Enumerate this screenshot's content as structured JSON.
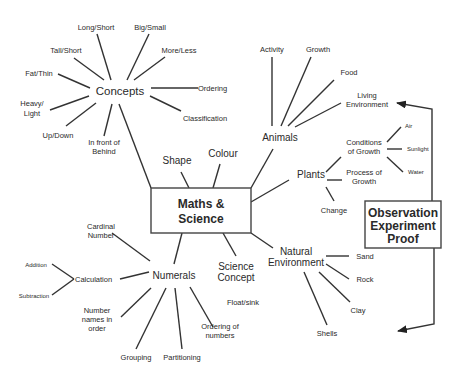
{
  "diagram": {
    "type": "concept-map",
    "central": {
      "line1": "Maths &",
      "line2": "Science"
    },
    "side_box": {
      "line1": "Observation",
      "line2": "Experiment",
      "line3": "Proof"
    },
    "concepts": {
      "label": "Concepts",
      "children": [
        "Long/Short",
        "Big/Small",
        "Tall/Short",
        "More/Less",
        "Fat/Thin",
        "Ordering",
        "Heavy/",
        "Light",
        "Classification",
        "Up/Down",
        "In front of",
        "Behind"
      ]
    },
    "shape": "Shape",
    "colour": "Colour",
    "animals": {
      "label": "Animals",
      "children": [
        "Activity",
        "Growth",
        "Food",
        "Living",
        "Environment"
      ]
    },
    "plants": {
      "label": "Plants",
      "conditions": {
        "line1": "Conditions",
        "line2": "of Growth",
        "children": [
          "Air",
          "Sunlight",
          "Water"
        ]
      },
      "process": {
        "line1": "Process of",
        "line2": "Growth"
      },
      "change": "Change"
    },
    "natural_environment": {
      "line1": "Natural",
      "line2": "Environment",
      "children": [
        "Sand",
        "Rock",
        "Clay",
        "Shells"
      ]
    },
    "science_concept": {
      "line1": "Science",
      "line2": "Concept",
      "child": "Float/sink"
    },
    "numerals": {
      "label": "Numerals",
      "cardinal": {
        "line1": "Cardinal",
        "line2": "Number"
      },
      "calculation": {
        "label": "Calculation",
        "children": [
          "Addition",
          "Subtraction"
        ]
      },
      "number_names": {
        "line1": "Number",
        "line2": "names in",
        "line3": "order"
      },
      "grouping": "Grouping",
      "partitioning": "Partitioning",
      "ordering": {
        "line1": "Ordering of",
        "line2": "numbers"
      }
    }
  }
}
